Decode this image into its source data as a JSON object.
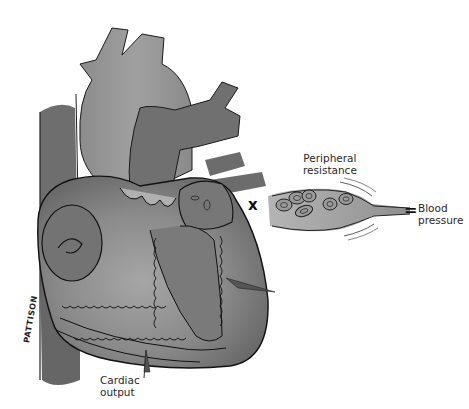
{
  "diagram": {
    "labels": {
      "peripheral_resistance_line1": "Peripheral",
      "peripheral_resistance_line2": "resistance",
      "blood_pressure_line1": "Blood",
      "blood_pressure_line2": "pressure",
      "cardiac_output_line1": "Cardiac",
      "cardiac_output_line2": "output"
    },
    "operators": {
      "multiply": "x",
      "equals": "="
    },
    "signature": "PATTISON",
    "colors": {
      "background": "#ffffff",
      "heart_dark": "#6f6f6f",
      "heart_mid": "#8a8a8a",
      "heart_light": "#a9a9a9",
      "outline": "#1a1a1a",
      "vessel_fill": "#9a9a9a",
      "text": "#2a2a2a"
    }
  }
}
